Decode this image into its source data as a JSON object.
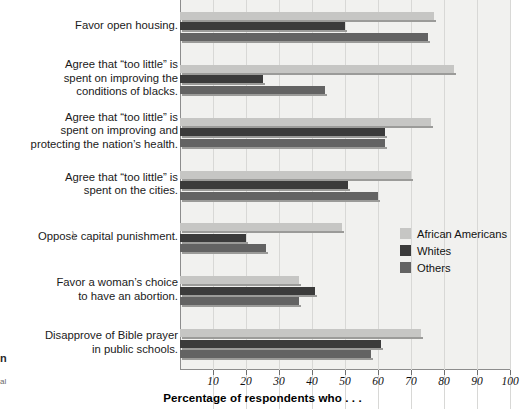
{
  "chart_data": {
    "type": "bar",
    "orientation": "horizontal",
    "title": "",
    "xlabel": "Percentage of respondents who . . .",
    "ylabel": "",
    "xlim": [
      0,
      105
    ],
    "xticks": [
      10,
      20,
      30,
      40,
      50,
      60,
      70,
      80,
      90,
      100
    ],
    "grid": true,
    "legend_position": "inside-right",
    "categories": [
      "Favor open housing.",
      "Agree that “too little” is\nspent on improving the\nconditions of blacks.",
      "Agree that “too little” is\nspent on improving and\nprotecting the nation’s health.",
      "Agree that “too little” is\nspent on the cities.",
      "Oppose capital punishment.",
      "Favor a woman’s choice\nto have an abortion.",
      "Disapprove of Bible prayer\nin public schools."
    ],
    "series": [
      {
        "name": "African Americans",
        "color": "#c6c6c4",
        "values": [
          77,
          83,
          76,
          70,
          49,
          36,
          73
        ]
      },
      {
        "name": "Whites",
        "color": "#3b3b3b",
        "values": [
          50,
          25,
          62,
          51,
          20,
          41,
          61
        ]
      },
      {
        "name": "Others",
        "color": "#636363",
        "values": [
          75,
          44,
          62,
          60,
          26,
          36,
          58
        ]
      }
    ]
  },
  "axis": {
    "title": "Percentage of respondents who . . .",
    "tick_labels": [
      "10",
      "20",
      "30",
      "40",
      "50",
      "60",
      "70",
      "80",
      "90",
      "100"
    ]
  },
  "legend": {
    "items": [
      {
        "label": "African Americans",
        "swatch": "african",
        "color": "#c6c6c4"
      },
      {
        "label": "Whites",
        "swatch": "whites",
        "color": "#3b3b3b"
      },
      {
        "label": "Others",
        "swatch": "others",
        "color": "#636363"
      }
    ]
  },
  "margin_fragments": {
    "bold_fragment": "n",
    "small_fragment": "al",
    "slash_fragment": "\\"
  },
  "colors": {
    "plot_background": "#f1f1ef",
    "gridline": "#d8d8d6",
    "axis_line": "#8d8d8d",
    "bar_shadow": "#9b9b99",
    "text": "#1a1a1a"
  }
}
